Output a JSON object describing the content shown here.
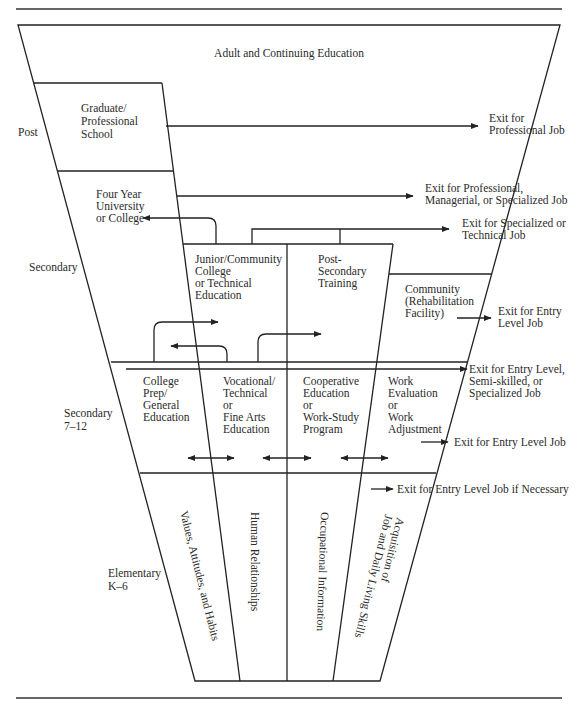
{
  "colors": {
    "ink": "#222222",
    "background": "#ffffff"
  },
  "levels": {
    "post": "Post",
    "secondary": "Secondary",
    "secondary_712": [
      "Secondary",
      "7–12"
    ],
    "elementary": [
      "Elementary",
      "K–6"
    ]
  },
  "boxes": {
    "adult": "Adult and Continuing Education",
    "graduate": [
      "Graduate/",
      "Professional",
      "School"
    ],
    "university": [
      "Four Year",
      "University",
      "or College"
    ],
    "junior": [
      "Junior/Community",
      "College",
      "or Technical",
      "Education"
    ],
    "postsecondary": [
      "Post-",
      "Secondary",
      "Training"
    ],
    "community": [
      "Community",
      "(Rehabilitation",
      "Facility)"
    ],
    "college_prep": [
      "College",
      "Prep/",
      "General",
      "Education"
    ],
    "vocational": [
      "Vocational/",
      "Technical",
      "or",
      "Fine Arts",
      "Education"
    ],
    "cooperative": [
      "Cooperative",
      "Education",
      "or",
      "Work-Study",
      "Program"
    ],
    "work_eval": [
      "Work",
      "Evaluation",
      "or",
      "Work",
      "Adjustment"
    ]
  },
  "elementary_columns": [
    "Values, Attitudes, and Habits",
    "Human Relationships",
    "Occupational Information",
    [
      "Acquisition of",
      "Job and Daily Living Skills"
    ]
  ],
  "exits": {
    "professional": [
      "Exit for",
      "Professional Job"
    ],
    "managerial": [
      "Exit for Professional,",
      "Managerial, or Specialized Job"
    ],
    "technical": [
      "Exit for Specialized or",
      "Technical Job"
    ],
    "entry_community": [
      "Exit for Entry",
      "Level Job"
    ],
    "entry_semi": [
      "Exit for Entry Level,",
      "Semi-skilled, or",
      "Specialized Job"
    ],
    "entry_work": "Exit for Entry Level Job",
    "entry_necessary": "Exit for Entry Level Job if Necessary"
  }
}
